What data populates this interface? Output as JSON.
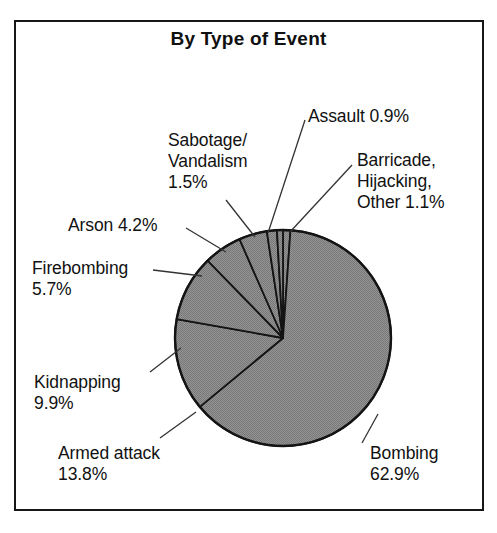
{
  "chart_data": {
    "type": "pie",
    "title": "By Type of Event",
    "xlabel": "",
    "ylabel": "",
    "legend_position": "none",
    "grid": false,
    "units": "percent",
    "categories": [
      "Barricade, Hijacking, Other",
      "Bombing",
      "Armed attack",
      "Kidnapping",
      "Firebombing",
      "Arson",
      "Sabotage/Vandalism",
      "Assault"
    ],
    "values": [
      1.1,
      62.9,
      13.8,
      9.9,
      5.7,
      4.2,
      1.5,
      0.9
    ],
    "slice_fill_color": "#8a8a8a",
    "slice_stroke_color": "#141414",
    "start_angle_deg": 0,
    "direction": "clockwise",
    "slices": [
      {
        "label": "Barricade, Hijacking, Other",
        "value": 1.1,
        "label_text": "Barricade,\nHijacking,\nOther 1.1%"
      },
      {
        "label": "Bombing",
        "value": 62.9,
        "label_text": "Bombing\n62.9%"
      },
      {
        "label": "Armed attack",
        "value": 13.8,
        "label_text": "Armed attack\n13.8%"
      },
      {
        "label": "Kidnapping",
        "value": 9.9,
        "label_text": "Kidnapping\n9.9%"
      },
      {
        "label": "Firebombing",
        "value": 5.7,
        "label_text": "Firebombing\n5.7%"
      },
      {
        "label": "Arson",
        "value": 4.2,
        "label_text": "Arson 4.2%"
      },
      {
        "label": "Sabotage/Vandalism",
        "value": 1.5,
        "label_text": "Sabotage/\nVandalism\n1.5%"
      },
      {
        "label": "Assault",
        "value": 0.9,
        "label_text": "Assault 0.9%"
      }
    ]
  },
  "labels": {
    "assault": "Assault 0.9%",
    "barricade": "Barricade,\nHijacking,\nOther 1.1%",
    "sabotage": "Sabotage/\nVandalism\n1.5%",
    "arson": "Arson 4.2%",
    "firebombing": "Firebombing\n5.7%",
    "kidnapping": "Kidnapping\n9.9%",
    "armed_attack": "Armed attack\n13.8%",
    "bombing": "Bombing\n62.9%"
  },
  "colors": {
    "frame_border": "#161616",
    "pie_fill": "#8a8a8a",
    "pie_stroke": "#141414",
    "leader_line": "#333333",
    "text": "#111111",
    "background": "#ffffff"
  }
}
